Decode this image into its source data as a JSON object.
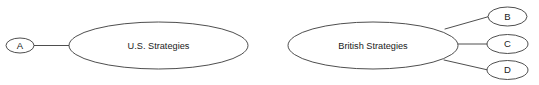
{
  "diagram": {
    "type": "concept-map",
    "background_color": "#ffffff",
    "stroke_color": "#3a3a3a",
    "text_color": "#1a1a1a",
    "clusters": [
      {
        "id": "us-cluster",
        "center_node": {
          "id": "us-strategies",
          "label": "U.S. Strategies",
          "shape": "ellipse",
          "cx": 158.5,
          "cy": 45.5,
          "rx": 89.5,
          "ry": 23.5
        },
        "leaf_nodes": [
          {
            "id": "node-a",
            "label": "A",
            "shape": "ellipse",
            "cx": 20.0,
            "cy": 45.5,
            "rx": 14.0,
            "ry": 7.5
          }
        ],
        "edges": [
          {
            "id": "edge-a-us",
            "from": "node-a",
            "to": "us-strategies",
            "x1": 34.0,
            "y1": 45.5,
            "x2": 70.0,
            "y2": 45.5
          }
        ]
      },
      {
        "id": "british-cluster",
        "center_node": {
          "id": "british-strategies",
          "label": "British Strategies",
          "shape": "ellipse",
          "cx": 373.0,
          "cy": 45.5,
          "rx": 85.0,
          "ry": 23.5
        },
        "leaf_nodes": [
          {
            "id": "node-b",
            "label": "B",
            "shape": "ellipse",
            "cx": 507.5,
            "cy": 16.5,
            "rx": 19.5,
            "ry": 9.5
          },
          {
            "id": "node-c",
            "label": "C",
            "shape": "ellipse",
            "cx": 507.5,
            "cy": 44.0,
            "rx": 20.5,
            "ry": 9.5
          },
          {
            "id": "node-d",
            "label": "D",
            "shape": "ellipse",
            "cx": 507.5,
            "cy": 70.0,
            "rx": 20.5,
            "ry": 9.5
          }
        ],
        "edges": [
          {
            "id": "edge-british-b",
            "from": "british-strategies",
            "to": "node-b",
            "x1": 445.0,
            "y1": 29.0,
            "x2": 488.0,
            "y2": 16.5
          },
          {
            "id": "edge-british-c",
            "from": "british-strategies",
            "to": "node-c",
            "x1": 458.0,
            "y1": 44.0,
            "x2": 487.0,
            "y2": 44.0
          },
          {
            "id": "edge-british-d",
            "from": "british-strategies",
            "to": "node-d",
            "x1": 444.0,
            "y1": 60.0,
            "x2": 487.0,
            "y2": 70.0
          }
        ]
      }
    ]
  }
}
